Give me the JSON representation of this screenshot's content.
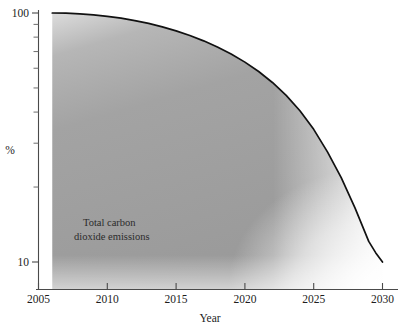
{
  "chart_data": {
    "type": "area",
    "title": "",
    "subtitle": "",
    "xlabel": "Year",
    "ylabel": "%",
    "xlim": [
      2005,
      2030
    ],
    "ylim": [
      10,
      100
    ],
    "yscale": "log",
    "grid": false,
    "legend": "none",
    "x_ticks": [
      2005,
      2010,
      2015,
      2020,
      2025,
      2030
    ],
    "x_tick_labels": [
      "2005",
      "2010",
      "2015",
      "2020",
      "2025",
      "2030"
    ],
    "y_ticks": [
      10,
      100
    ],
    "y_tick_labels": [
      "10",
      "100"
    ],
    "y_minor_ticks": [
      20,
      30,
      40,
      50,
      60,
      70,
      80,
      90
    ],
    "series": [
      {
        "name": "Total carbon dioxide emissions",
        "x": [
          2006.0,
          2007.0,
          2008.0,
          2009.0,
          2010.0,
          2011.0,
          2012.0,
          2013.0,
          2014.0,
          2015.0,
          2016.0,
          2017.0,
          2018.0,
          2019.0,
          2020.0,
          2021.0,
          2022.0,
          2023.0,
          2024.0,
          2025.0,
          2026.0,
          2027.0,
          2028.0,
          2029.0,
          2029.5,
          2030.0
        ],
        "values": [
          100.0,
          99.8,
          99.2,
          98.3,
          97.0,
          95.3,
          93.2,
          90.8,
          88.0,
          84.8,
          81.2,
          77.3,
          73.0,
          68.4,
          63.5,
          58.2,
          52.6,
          46.7,
          40.5,
          34.1,
          27.7,
          21.8,
          16.5,
          12.1,
          10.9,
          10.0
        ]
      }
    ],
    "annotations": [
      {
        "text_line_1": "Total carbon",
        "text_line_2": "dioxide emissions",
        "x": 2011.5,
        "y": 17
      }
    ],
    "fill_color": "#9d9d9d",
    "line_color": "#111111",
    "axis_color": "#4a4a4a"
  },
  "axis": {
    "y_label": "%",
    "x_label": "Year",
    "y_tick_top": "100",
    "y_tick_bottom": "10",
    "x_tick_1": "2005",
    "x_tick_2": "2010",
    "x_tick_3": "2015",
    "x_tick_4": "2020",
    "x_tick_5": "2025",
    "x_tick_6": "2030"
  },
  "annotation": {
    "line1": "Total carbon",
    "line2": "dioxide emissions"
  }
}
